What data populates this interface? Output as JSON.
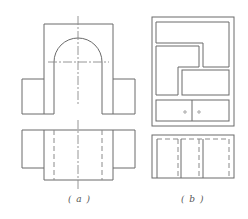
{
  "figure": {
    "panels": [
      {
        "id": "a",
        "label": "( a )",
        "description": "Front and top orthographic views of an arched block with side wings"
      },
      {
        "id": "b",
        "label": "( b )",
        "description": "Front and top views of a cabinet with compartments and two drawers"
      }
    ]
  },
  "colors": {
    "line": "#6a6a6a",
    "hidden_line": "#8a8a8a",
    "background": "#ffffff"
  }
}
